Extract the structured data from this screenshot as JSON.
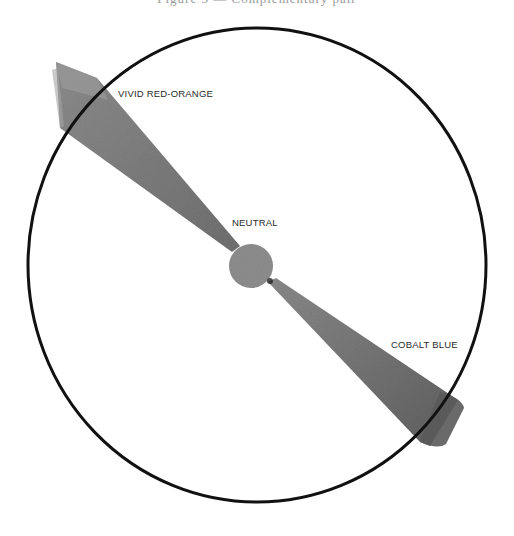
{
  "header": {
    "cropped_caption": "Figure 3 — Complementary pair"
  },
  "diagram": {
    "type": "color-wheel-complementary-axis",
    "labels": {
      "vivid": "VIVID RED-ORANGE",
      "neutral": "NEUTRAL",
      "cobalt": "COBALT BLUE"
    },
    "colors": {
      "circle_stroke": "#111111",
      "wedge_fill": "#8a8a8a",
      "wedge_end_fill": "#7a7a7a",
      "neutral_fill": "#8e8e8e",
      "background": "#ffffff"
    }
  }
}
